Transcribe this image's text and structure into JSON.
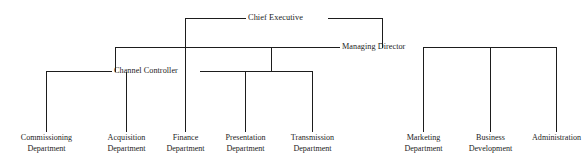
{
  "diagram": {
    "type": "organizational-chart",
    "background_color": "#ffffff",
    "line_color": "#1d1d1d",
    "text_color": "#1d1d1d",
    "nodes": {
      "chief_executive": {
        "label": "Chief Executive",
        "level": 1
      },
      "managing_director": {
        "label": "Managing Director",
        "level": 2
      },
      "channel_controller": {
        "label": "Channel Controller",
        "level": 3
      }
    },
    "channel_controller_departments": [
      {
        "line1": "Commissioning",
        "line2": "Department"
      },
      {
        "line1": "Acquisition",
        "line2": "Department"
      },
      {
        "line1": "Finance",
        "line2": "Department"
      },
      {
        "line1": "Presentation",
        "line2": "Department"
      },
      {
        "line1": "Transmission",
        "line2": "Department"
      }
    ],
    "managing_director_departments": [
      {
        "line1": "Marketing",
        "line2": "Department"
      },
      {
        "line1": "Business",
        "line2": "Development"
      },
      {
        "line1": "Administration",
        "line2": ""
      }
    ]
  }
}
